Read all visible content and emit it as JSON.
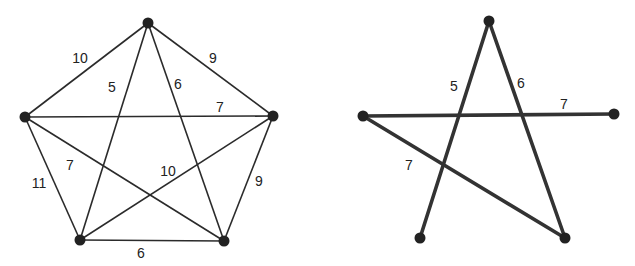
{
  "left_graph": {
    "nodes": [
      {
        "id": "A",
        "x": 148,
        "y": 23
      },
      {
        "id": "B",
        "x": 25,
        "y": 117
      },
      {
        "id": "C",
        "x": 273,
        "y": 116
      },
      {
        "id": "D",
        "x": 80,
        "y": 240
      },
      {
        "id": "E",
        "x": 224,
        "y": 241
      }
    ],
    "edges": [
      {
        "from": "A",
        "to": "B",
        "weight": "10",
        "lx": 80,
        "ly": 63
      },
      {
        "from": "A",
        "to": "C",
        "weight": "9",
        "lx": 213,
        "ly": 63
      },
      {
        "from": "A",
        "to": "D",
        "weight": "5",
        "lx": 112,
        "ly": 92
      },
      {
        "from": "A",
        "to": "E",
        "weight": "6",
        "lx": 178,
        "ly": 89
      },
      {
        "from": "B",
        "to": "C",
        "weight": "7",
        "lx": 220,
        "ly": 112
      },
      {
        "from": "B",
        "to": "E",
        "weight": "7",
        "lx": 70,
        "ly": 170
      },
      {
        "from": "C",
        "to": "D",
        "weight": "10",
        "lx": 168,
        "ly": 176
      },
      {
        "from": "B",
        "to": "D",
        "weight": "11",
        "lx": 39,
        "ly": 188
      },
      {
        "from": "C",
        "to": "E",
        "weight": "9",
        "lx": 259,
        "ly": 186
      },
      {
        "from": "D",
        "to": "E",
        "weight": "6",
        "lx": 141,
        "ly": 258
      }
    ]
  },
  "right_graph": {
    "nodes": [
      {
        "id": "A",
        "x": 489,
        "y": 21
      },
      {
        "id": "B",
        "x": 363,
        "y": 116
      },
      {
        "id": "C",
        "x": 614,
        "y": 114
      },
      {
        "id": "D",
        "x": 420,
        "y": 238
      },
      {
        "id": "E",
        "x": 565,
        "y": 238
      }
    ],
    "edges": [
      {
        "from": "A",
        "to": "D",
        "weight": "5",
        "lx": 454,
        "ly": 91
      },
      {
        "from": "A",
        "to": "E",
        "weight": "6",
        "lx": 521,
        "ly": 88
      },
      {
        "from": "B",
        "to": "C",
        "weight": "7",
        "lx": 564,
        "ly": 109
      },
      {
        "from": "B",
        "to": "E",
        "weight": "7",
        "lx": 409,
        "ly": 170
      }
    ]
  }
}
